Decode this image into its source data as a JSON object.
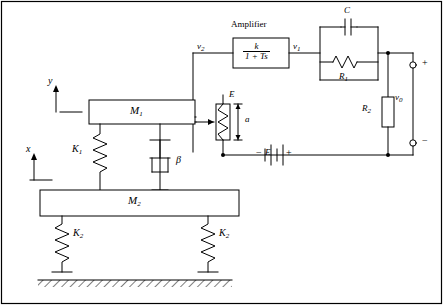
{
  "figure": {
    "type": "electro-mechanical-schematic",
    "background": "#ffffff",
    "line_color": "#000000"
  },
  "blocks": {
    "amplifier": {
      "caption": "Amplifier",
      "numerator": "k",
      "denominator": "1 + Ts"
    }
  },
  "masses": {
    "m1": "M",
    "m1_sub": "1",
    "m2": "M",
    "m2_sub": "2"
  },
  "springs": {
    "k1": "K",
    "k1_sub": "1",
    "k2_left": "K",
    "k2_left_sub": "2",
    "k2_right": "K",
    "k2_right_sub": "2"
  },
  "damper": {
    "label": "β"
  },
  "displacements": {
    "y": "y",
    "x": "x"
  },
  "potentiometer": {
    "top_label": "E",
    "span_label": "a"
  },
  "battery": {
    "label": "E",
    "minus": "−",
    "plus": "+"
  },
  "signals": {
    "v2": "v",
    "v2_sub": "2",
    "v1": "v",
    "v1_sub": "1",
    "v0": "v",
    "v0_sub": "0"
  },
  "components": {
    "capacitor": "C",
    "resistor_r1": "R",
    "resistor_r1_sub": "1",
    "resistor_r2": "R",
    "resistor_r2_sub": "2"
  },
  "terminals": {
    "plus": "+",
    "minus": "−"
  }
}
